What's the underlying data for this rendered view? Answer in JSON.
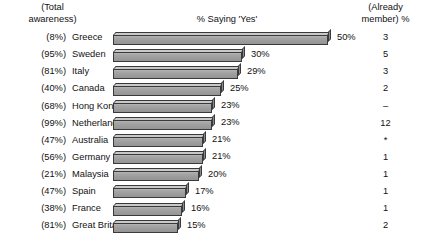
{
  "header": {
    "left_line1": "(Total",
    "left_line2": "awareness)",
    "middle": "% Saying 'Yes'",
    "right_line1": "(Already",
    "right_line2": "member) %"
  },
  "chart_data": {
    "type": "bar",
    "orientation": "horizontal",
    "title": "% Saying 'Yes'",
    "xlabel": "",
    "ylabel": "",
    "grid": false,
    "legend": null,
    "xlim": [
      0,
      50
    ],
    "categories": [
      "Greece",
      "Sweden",
      "Italy",
      "Canada",
      "Hong Kong",
      "Netherlands",
      "Australia",
      "Germany",
      "Malaysia",
      "Spain",
      "France",
      "Great Britain"
    ],
    "values": [
      50,
      30,
      29,
      25,
      23,
      23,
      21,
      21,
      20,
      17,
      16,
      15
    ],
    "value_labels": [
      "50%",
      "30%",
      "29%",
      "25%",
      "23%",
      "23%",
      "21%",
      "21%",
      "20%",
      "17%",
      "16%",
      "15%"
    ],
    "total_awareness": [
      "(8%)",
      "(95%)",
      "(81%)",
      "(40%)",
      "(68%)",
      "(99%)",
      "(47%)",
      "(56%)",
      "(21%)",
      "(47%)",
      "(38%)",
      "(81%)"
    ],
    "already_member": [
      "3",
      "5",
      "3",
      "2",
      "–",
      "12",
      "*",
      "1",
      "1",
      "1",
      "1",
      "2"
    ],
    "bar_color": "#9d9d9d",
    "bar_top_color": "#c9c9c9",
    "bar_outline_color": "#3a3a3a"
  },
  "rows": [
    {
      "awareness": "(8%)",
      "country": "Greece",
      "value": 50,
      "label": "50%",
      "member": "3"
    },
    {
      "awareness": "(95%)",
      "country": "Sweden",
      "value": 30,
      "label": "30%",
      "member": "5"
    },
    {
      "awareness": "(81%)",
      "country": "Italy",
      "value": 29,
      "label": "29%",
      "member": "3"
    },
    {
      "awareness": "(40%)",
      "country": "Canada",
      "value": 25,
      "label": "25%",
      "member": "2"
    },
    {
      "awareness": "(68%)",
      "country": "Hong Kong",
      "value": 23,
      "label": "23%",
      "member": "–"
    },
    {
      "awareness": "(99%)",
      "country": "Netherlands",
      "value": 23,
      "label": "23%",
      "member": "12"
    },
    {
      "awareness": "(47%)",
      "country": "Australia",
      "value": 21,
      "label": "21%",
      "member": "*"
    },
    {
      "awareness": "(56%)",
      "country": "Germany",
      "value": 21,
      "label": "21%",
      "member": "1"
    },
    {
      "awareness": "(21%)",
      "country": "Malaysia",
      "value": 20,
      "label": "20%",
      "member": "1"
    },
    {
      "awareness": "(47%)",
      "country": "Spain",
      "value": 17,
      "label": "17%",
      "member": "1"
    },
    {
      "awareness": "(38%)",
      "country": "France",
      "value": 16,
      "label": "16%",
      "member": "1"
    },
    {
      "awareness": "(81%)",
      "country": "Great Britain",
      "value": 15,
      "label": "15%",
      "member": "2"
    }
  ]
}
